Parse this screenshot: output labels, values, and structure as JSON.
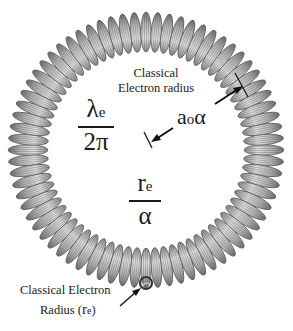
{
  "diagram": {
    "type": "toroidal helix (coil ring) model of the electron",
    "colors": {
      "background": "#ffffff",
      "coil_fill": "#b5b5b5",
      "coil_stroke": "#555555",
      "coil_highlight": "#e2e2e2",
      "text": "#1a1a1a"
    },
    "ring": {
      "cx": 146,
      "cy": 150,
      "outer_radius": 136,
      "inner_radius": 100,
      "loop_count": 72
    },
    "labels": {
      "inner_radius_caption_line1": "Classical",
      "inner_radius_caption_line2": "Electron radius",
      "compton_fraction": {
        "numerator_symbol": "λ",
        "numerator_sub": "e",
        "denominator": "2π"
      },
      "bohr_alpha": {
        "symbol": "a",
        "sub": "o",
        "suffix": "α"
      },
      "re_over_alpha": {
        "numerator_symbol": "r",
        "numerator_sub": "e",
        "denominator": "α"
      },
      "small_loop_caption_line1": "Classical Electron",
      "small_loop_caption_line2_prefix": "Radius (",
      "small_loop_caption_line2_symbol": "r",
      "small_loop_caption_line2_sub": "e",
      "small_loop_caption_line2_suffix": ")"
    }
  }
}
